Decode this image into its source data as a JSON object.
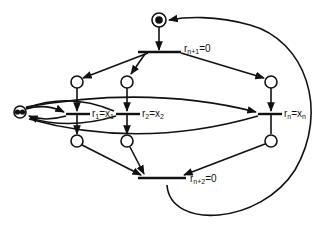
{
  "diagram": {
    "type": "petri-net",
    "colors": {
      "stroke": "#111111",
      "background": "#ffffff"
    },
    "transitions": [
      {
        "id": "t_top",
        "label": "r",
        "sub": "n+1",
        "eq": "=0"
      },
      {
        "id": "t1",
        "label": "r",
        "sub": "1",
        "eq": "=x",
        "eqsub": "1"
      },
      {
        "id": "t2",
        "label": "r",
        "sub": "2",
        "eq": "=x",
        "eqsub": "2"
      },
      {
        "id": "tn",
        "label": "r",
        "sub": "n",
        "eq": "=x",
        "eqsub": "n"
      },
      {
        "id": "t_bottom",
        "label": "r",
        "sub": "n+2",
        "eq": "=0"
      }
    ],
    "places": [
      {
        "id": "p_start",
        "marked": true,
        "tokens": 1
      },
      {
        "id": "p_left",
        "marked": true,
        "tokens": 2
      },
      {
        "id": "p_in1",
        "tokens": 0
      },
      {
        "id": "p_in2",
        "tokens": 0
      },
      {
        "id": "p_inn",
        "tokens": 0
      },
      {
        "id": "p_out1",
        "tokens": 0
      },
      {
        "id": "p_out2",
        "tokens": 0
      },
      {
        "id": "p_outn",
        "tokens": 0
      }
    ]
  }
}
